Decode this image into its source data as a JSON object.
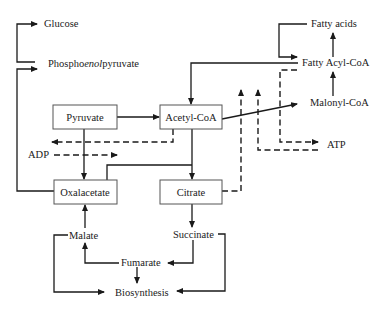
{
  "diagram": {
    "type": "metabolic-pathway",
    "colors": {
      "line": "#1a1a1a",
      "box_border": "#555555",
      "background": "#ffffff"
    },
    "boxes": {
      "pyruvate": "Pyruvate",
      "acetyl_coa": "Acetyl-CoA",
      "oxalacetate": "Oxalacetate",
      "citrate": "Citrate"
    },
    "labels": {
      "glucose": "Glucose",
      "pep_prefix": "Phospho",
      "pep_italic": "enol",
      "pep_suffix": "pyruvate",
      "fatty_acids": "Fatty acids",
      "fatty_acyl_coa": "Fatty Acyl-CoA",
      "malonyl_coa": "Malonyl-CoA",
      "adp": "ADP",
      "atp": "ATP",
      "malate": "Malate",
      "succinate": "Succinate",
      "fumarate": "Fumarate",
      "biosynthesis": "Biosynthesis"
    },
    "edges": [
      {
        "from": "Phosphoenolpyruvate",
        "to": "Glucose",
        "style": "solid"
      },
      {
        "from": "Oxalacetate",
        "to": "Phosphoenolpyruvate",
        "style": "solid"
      },
      {
        "from": "Pyruvate",
        "to": "Acetyl-CoA",
        "style": "solid"
      },
      {
        "from": "Pyruvate",
        "to": "Oxalacetate",
        "style": "solid"
      },
      {
        "from": "Fatty Acyl-CoA",
        "to": "Acetyl-CoA",
        "style": "solid"
      },
      {
        "from": "Acetyl-CoA",
        "to": "Malonyl-CoA",
        "style": "solid"
      },
      {
        "from": "Acetyl-CoA",
        "to": "Citrate",
        "style": "solid"
      },
      {
        "from": "Oxalacetate",
        "to": "Citrate",
        "style": "solid"
      },
      {
        "from": "Citrate",
        "to": "Succinate",
        "style": "solid"
      },
      {
        "from": "Succinate",
        "to": "Fumarate",
        "style": "solid"
      },
      {
        "from": "Succinate",
        "to": "Biosynthesis",
        "style": "solid"
      },
      {
        "from": "Fumarate",
        "to": "Malate",
        "style": "solid"
      },
      {
        "from": "Fumarate",
        "to": "Biosynthesis",
        "style": "solid"
      },
      {
        "from": "Malate",
        "to": "Oxalacetate",
        "style": "solid"
      },
      {
        "from": "Malate",
        "to": "Biosynthesis",
        "style": "solid"
      },
      {
        "from": "Malonyl-CoA",
        "to": "Fatty Acyl-CoA",
        "style": "solid"
      },
      {
        "from": "Fatty Acyl-CoA",
        "to": "Fatty acids",
        "style": "solid"
      },
      {
        "from": "Fatty acids",
        "to": "Fatty Acyl-CoA",
        "style": "solid"
      },
      {
        "from": "Acetyl-CoA",
        "to": "Pyruvate region (inhibition)",
        "style": "dashed"
      },
      {
        "from": "ADP",
        "to": "Pyruvate-Oxalacetate step",
        "style": "dashed"
      },
      {
        "from": "Citrate",
        "to": "Acetyl-CoA-Malonyl-CoA step",
        "style": "dashed"
      },
      {
        "from": "ATP",
        "to": "Acetyl-CoA-Malonyl-CoA step",
        "style": "dashed"
      },
      {
        "from": "Fatty Acyl-CoA",
        "to": "ATP",
        "style": "dashed"
      }
    ]
  }
}
